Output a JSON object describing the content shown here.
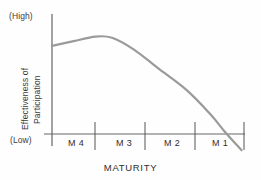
{
  "chart_data": {
    "type": "line",
    "title": "",
    "xlabel": "MATURITY",
    "ylabel": "Effectiveness of Participation",
    "ylabel_lines": [
      "Effectiveness of",
      "Participation"
    ],
    "y_axis_top_label": "(High)",
    "y_axis_bottom_label": "(Low)",
    "categories": [
      "M 4",
      "M 3",
      "M 2",
      "M 1"
    ],
    "grid": false,
    "legend": null,
    "line_color": "#9a9a9a",
    "axis_color": "#555555",
    "xlim": [
      0,
      4
    ],
    "ylim": [
      0,
      1
    ],
    "series": [
      {
        "name": "Effectiveness of Participation",
        "points": [
          {
            "x": 0.0,
            "y": 0.76
          },
          {
            "x": 0.45,
            "y": 0.8
          },
          {
            "x": 0.9,
            "y": 0.84
          },
          {
            "x": 1.25,
            "y": 0.83
          },
          {
            "x": 1.7,
            "y": 0.73
          },
          {
            "x": 2.2,
            "y": 0.57
          },
          {
            "x": 2.8,
            "y": 0.38
          },
          {
            "x": 3.3,
            "y": 0.17
          },
          {
            "x": 3.6,
            "y": 0.02
          },
          {
            "x": 3.95,
            "y": -0.14
          }
        ]
      }
    ],
    "annotations": [
      "Curve peaks near the M 4 / M 3 boundary and declines steadily, crossing the (Low) baseline within M 1."
    ]
  },
  "axis": {
    "high_label": "(High)",
    "low_label": "(Low)",
    "x_title": "MATURITY",
    "y_title_lines": [
      "Effectiveness of",
      "Participation"
    ],
    "ticks": [
      "M 4",
      "M 3",
      "M 2",
      "M 1"
    ]
  }
}
